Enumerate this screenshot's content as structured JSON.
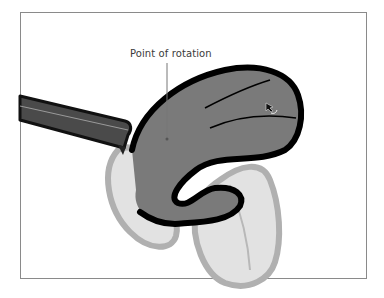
{
  "figure": {
    "callout_label": "Point of rotation",
    "elements": [
      {
        "name": "handle-stem",
        "description": "dark angled stem entering from left"
      },
      {
        "name": "leaf-shape-main",
        "description": "dark gray leaf shape with black outline (rotated)"
      },
      {
        "name": "leaf-shape-ghost",
        "description": "light gray leaf shapes showing original position"
      },
      {
        "name": "rotation-cursor",
        "description": "rotate cursor arrow"
      }
    ],
    "colors": {
      "frame_border": "#8a8a8a",
      "leaf_fill": "#7a7a7a",
      "leaf_outline": "#000000",
      "ghost_fill": "#e2e2e2",
      "ghost_outline": "#b0b0b0",
      "stem_fill": "#4a4a4a",
      "callout_line": "#777777"
    }
  }
}
